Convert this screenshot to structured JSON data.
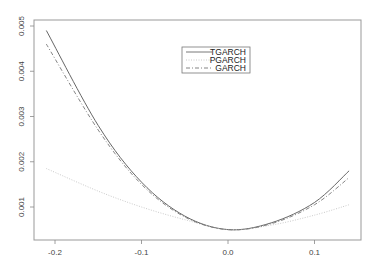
{
  "chart_data": {
    "type": "line",
    "title": "",
    "xlabel": "",
    "ylabel": "",
    "xlim": [
      -0.22,
      0.15
    ],
    "ylim": [
      0.00035,
      0.0051
    ],
    "x_ticks": [
      "-0.2",
      "-0.1",
      "0.0",
      "0.1"
    ],
    "y_ticks": [
      "0.001",
      "0.002",
      "0.003",
      "0.004",
      "0.005"
    ],
    "grid": false,
    "legend_position": "top-center",
    "x": [
      -0.21,
      -0.15,
      -0.1,
      -0.05,
      0.0,
      0.05,
      0.1,
      0.14
    ],
    "series": [
      {
        "name": "TGARCH",
        "style": "solid",
        "values": [
          0.0049,
          0.0028,
          0.00155,
          0.0008,
          0.0005,
          0.00065,
          0.0011,
          0.0018
        ]
      },
      {
        "name": "PGARCH",
        "style": "dotted",
        "values": [
          0.00185,
          0.00135,
          0.001,
          0.00072,
          0.0005,
          0.0006,
          0.00082,
          0.00105
        ]
      },
      {
        "name": "GARCH",
        "style": "dashdot",
        "values": [
          0.0046,
          0.0027,
          0.0015,
          0.00078,
          0.0005,
          0.00063,
          0.00105,
          0.00165
        ]
      }
    ]
  },
  "legend": {
    "items": [
      "TGARCH",
      "PGARCH",
      "GARCH"
    ]
  },
  "axes": {
    "x_ticks": [
      "-0.2",
      "-0.1",
      "0.0",
      "0.1"
    ],
    "y_ticks": [
      "0.001",
      "0.002",
      "0.003",
      "0.004",
      "0.005"
    ]
  }
}
